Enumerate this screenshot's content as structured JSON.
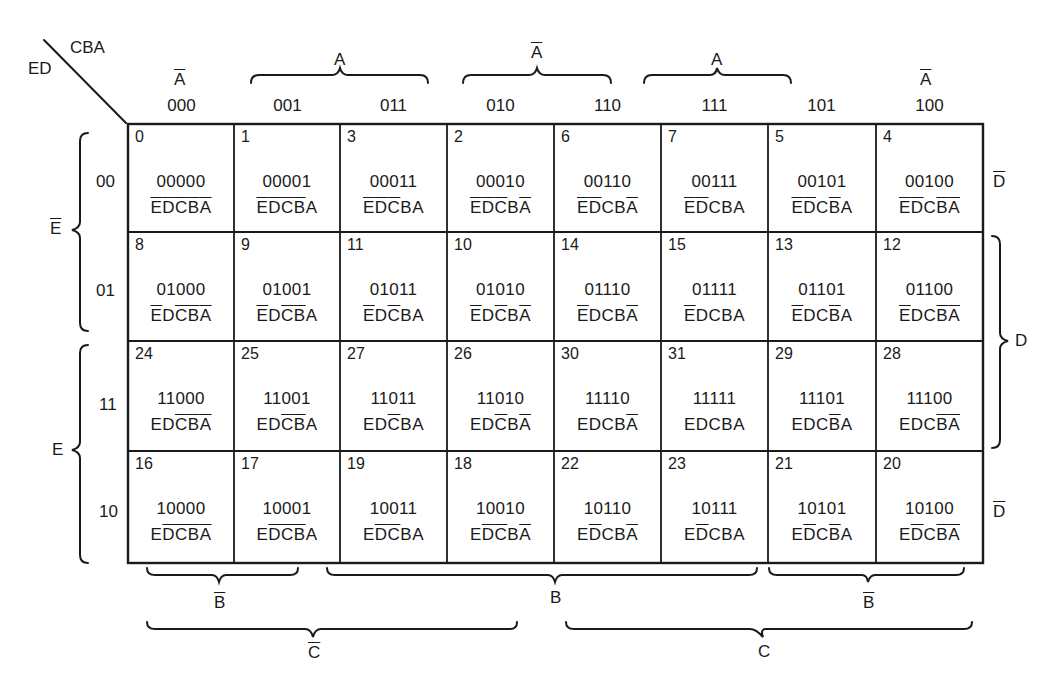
{
  "corner": {
    "col_vars": "CBA",
    "row_vars": "ED"
  },
  "columns": [
    {
      "code": "000"
    },
    {
      "code": "001"
    },
    {
      "code": "011"
    },
    {
      "code": "010"
    },
    {
      "code": "110"
    },
    {
      "code": "111"
    },
    {
      "code": "101"
    },
    {
      "code": "100"
    }
  ],
  "rows": [
    {
      "code": "00"
    },
    {
      "code": "01"
    },
    {
      "code": "11"
    },
    {
      "code": "10"
    }
  ],
  "top_groups": [
    {
      "label": "A",
      "complement": true,
      "span": "col 000",
      "brace": false
    },
    {
      "label": "A",
      "complement": false,
      "span": "cols 001-011",
      "brace": true
    },
    {
      "label": "A",
      "complement": true,
      "span": "cols 010-110",
      "brace": true
    },
    {
      "label": "A",
      "complement": false,
      "span": "cols 111-101",
      "brace": true
    },
    {
      "label": "A",
      "complement": true,
      "span": "col 100",
      "brace": false
    }
  ],
  "left_groups": [
    {
      "label": "E",
      "complement": true,
      "span": "rows 00-01"
    },
    {
      "label": "E",
      "complement": false,
      "span": "rows 11-10"
    }
  ],
  "right_groups": [
    {
      "label": "D",
      "complement": true,
      "span": "row 00",
      "brace": false
    },
    {
      "label": "D",
      "complement": false,
      "span": "rows 01-11",
      "brace": true
    },
    {
      "label": "D",
      "complement": true,
      "span": "row 10",
      "brace": false
    }
  ],
  "bottom_groups_b": [
    {
      "label": "B",
      "complement": true,
      "span": "cols 000-001"
    },
    {
      "label": "B",
      "complement": false,
      "span": "cols 011-111"
    },
    {
      "label": "B",
      "complement": true,
      "span": "cols 101-100"
    }
  ],
  "bottom_groups_c": [
    {
      "label": "C",
      "complement": true,
      "span": "cols 000-010"
    },
    {
      "label": "C",
      "complement": false,
      "span": "cols 110-100"
    }
  ],
  "cells": [
    [
      {
        "m": "0",
        "bin": "00000"
      },
      {
        "m": "1",
        "bin": "00001"
      },
      {
        "m": "3",
        "bin": "00011"
      },
      {
        "m": "2",
        "bin": "00010"
      },
      {
        "m": "6",
        "bin": "00110"
      },
      {
        "m": "7",
        "bin": "00111"
      },
      {
        "m": "5",
        "bin": "00101"
      },
      {
        "m": "4",
        "bin": "00100"
      }
    ],
    [
      {
        "m": "8",
        "bin": "01000"
      },
      {
        "m": "9",
        "bin": "01001"
      },
      {
        "m": "11",
        "bin": "01011"
      },
      {
        "m": "10",
        "bin": "01010"
      },
      {
        "m": "14",
        "bin": "01110"
      },
      {
        "m": "15",
        "bin": "01111"
      },
      {
        "m": "13",
        "bin": "01101"
      },
      {
        "m": "12",
        "bin": "01100"
      }
    ],
    [
      {
        "m": "24",
        "bin": "11000"
      },
      {
        "m": "25",
        "bin": "11001"
      },
      {
        "m": "27",
        "bin": "11011"
      },
      {
        "m": "26",
        "bin": "11010"
      },
      {
        "m": "30",
        "bin": "11110"
      },
      {
        "m": "31",
        "bin": "11111"
      },
      {
        "m": "29",
        "bin": "11101"
      },
      {
        "m": "28",
        "bin": "11100"
      }
    ],
    [
      {
        "m": "16",
        "bin": "10000"
      },
      {
        "m": "17",
        "bin": "10001"
      },
      {
        "m": "19",
        "bin": "10011"
      },
      {
        "m": "18",
        "bin": "10010"
      },
      {
        "m": "22",
        "bin": "10110"
      },
      {
        "m": "23",
        "bin": "10111"
      },
      {
        "m": "21",
        "bin": "10101"
      },
      {
        "m": "20",
        "bin": "10100"
      }
    ]
  ],
  "literal_letters": [
    "E",
    "D",
    "C",
    "B",
    "A"
  ],
  "colors": {
    "ink": "#1a1a1a",
    "background": "#ffffff"
  }
}
